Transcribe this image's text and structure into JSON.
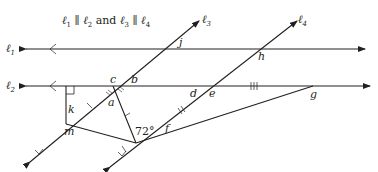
{
  "title": {
    "l1": "ℓ",
    "s1": "1",
    "par1": " ∥ ",
    "l2": "ℓ",
    "s2": "2",
    "and": " and ",
    "l3": "ℓ",
    "s3": "3",
    "par2": " ∥ ",
    "l4": "ℓ",
    "s4": "4"
  },
  "lines": {
    "l1": {
      "name": "ℓ",
      "sub": "1"
    },
    "l2": {
      "name": "ℓ",
      "sub": "2"
    },
    "l3": {
      "name": "ℓ",
      "sub": "3"
    },
    "l4": {
      "name": "ℓ",
      "sub": "4"
    }
  },
  "angles": {
    "a": "a",
    "b": "b",
    "c": "c",
    "d": "d",
    "e": "e",
    "f": "f",
    "g": "g",
    "h": "h",
    "j": "j",
    "k": "k",
    "m": "m",
    "given": "72°"
  },
  "colors": {
    "stroke": "#231f20"
  }
}
